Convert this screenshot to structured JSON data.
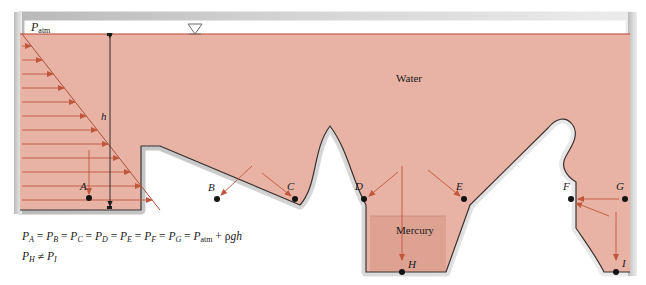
{
  "figure": {
    "type": "fluid-statics-diagram",
    "materials": [
      {
        "name": "Water",
        "label": "Water",
        "color": "#e8b3a5",
        "x": 412,
        "y": 78
      },
      {
        "name": "Mercury",
        "label": "Mercury",
        "color": "#dda291",
        "x": 400,
        "y": 231
      }
    ],
    "surface_label": {
      "text": "P",
      "sub": "atm",
      "x": 33,
      "y": 24
    },
    "depth_label": {
      "text": "h",
      "x": 104,
      "y": 117
    },
    "free_surface_marker": {
      "name": "free-surface-triangle",
      "x": 195,
      "y": 34
    },
    "points": [
      {
        "id": "A",
        "label": "A",
        "px": 89,
        "py": 198,
        "lx": 83,
        "ly": 186
      },
      {
        "id": "B",
        "label": "B",
        "px": 217,
        "py": 199,
        "lx": 210,
        "ly": 187
      },
      {
        "id": "C",
        "label": "C",
        "px": 295,
        "py": 199,
        "lx": 289,
        "ly": 186
      },
      {
        "id": "D",
        "label": "D",
        "px": 364,
        "py": 199,
        "lx": 357,
        "ly": 186
      },
      {
        "id": "E",
        "label": "E",
        "px": 464,
        "py": 199,
        "lx": 458,
        "ly": 186
      },
      {
        "id": "F",
        "label": "F",
        "px": 571,
        "py": 199,
        "lx": 565,
        "ly": 186
      },
      {
        "id": "G",
        "label": "G",
        "px": 625,
        "py": 199,
        "lx": 618,
        "ly": 186
      },
      {
        "id": "H",
        "label": "H",
        "px": 402,
        "py": 265,
        "lx": 407,
        "ly": 260
      },
      {
        "id": "I",
        "label": "I",
        "px": 616,
        "py": 265,
        "lx": 621,
        "ly": 259
      }
    ],
    "equations": [
      {
        "id": "equal-pressures",
        "text": "P_A = P_B = P_C = P_D = P_E = P_F = P_G = P_atm + rho g h"
      },
      {
        "id": "unequal-pressures",
        "text": "P_H != P_I"
      }
    ],
    "colors": {
      "water": "#e8b3a5",
      "mercury": "#dda291",
      "wall": "#c9c9c9",
      "outline": "#3a3230",
      "arrow": "#c0563c",
      "surface_line": "#b8432a",
      "point": "#141414"
    }
  }
}
